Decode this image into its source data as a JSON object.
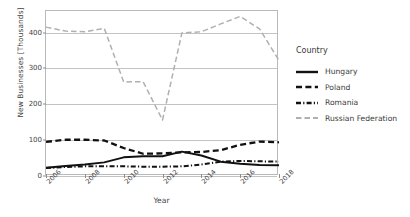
{
  "chart_data": {
    "type": "line",
    "title": "",
    "xlabel": "Year",
    "ylabel": "New Businesses [Thousands]",
    "xlim": [
      2006,
      2018
    ],
    "ylim": [
      0,
      460
    ],
    "yticks": [
      0,
      100,
      200,
      300,
      400
    ],
    "xticks": [
      2006,
      2008,
      2010,
      2012,
      2014,
      2016,
      2018
    ],
    "xtick_labels": [
      "2006",
      "2008",
      "2010",
      "2012",
      "2014",
      "2016",
      "2018"
    ],
    "grid": true,
    "legend_position": "right",
    "legend_title": "Country",
    "x": [
      2006,
      2007,
      2008,
      2009,
      2010,
      2011,
      2012,
      2013,
      2014,
      2015,
      2016,
      2017,
      2018
    ],
    "series": [
      {
        "name": "Hungary",
        "color": "#111111",
        "style": "solid",
        "values": [
          23,
          28,
          32,
          38,
          52,
          55,
          55,
          68,
          57,
          40,
          34,
          31,
          30
        ]
      },
      {
        "name": "Poland",
        "color": "#111111",
        "style": "dashed",
        "values": [
          95,
          101,
          101,
          99,
          78,
          62,
          63,
          66,
          67,
          72,
          87,
          96,
          94
        ]
      },
      {
        "name": "Romania",
        "color": "#111111",
        "style": "dashdot",
        "values": [
          22,
          25,
          27,
          27,
          27,
          26,
          26,
          27,
          32,
          40,
          42,
          41,
          40
        ]
      },
      {
        "name": "Russian Federation",
        "color": "#b0b0b0",
        "style": "dashed-light",
        "values": [
          415,
          404,
          402,
          412,
          262,
          263,
          156,
          399,
          402,
          424,
          445,
          410,
          322
        ]
      }
    ]
  },
  "legend": {
    "title": "Country",
    "items": [
      {
        "label": "Hungary",
        "swatch": "solid-line-swatch"
      },
      {
        "label": "Poland",
        "swatch": "dashed-line-swatch"
      },
      {
        "label": "Romania",
        "swatch": "dashdot-line-swatch"
      },
      {
        "label": "Russian Federation",
        "swatch": "light-dashed-line-swatch"
      }
    ]
  },
  "axes": {
    "y_title": "New Businesses [Thousands]",
    "x_title": "Year",
    "y_ticks": [
      "0",
      "100",
      "200",
      "300",
      "400"
    ],
    "x_ticks": [
      "2006",
      "2008",
      "2010",
      "2012",
      "2014",
      "2016",
      "2018"
    ]
  }
}
